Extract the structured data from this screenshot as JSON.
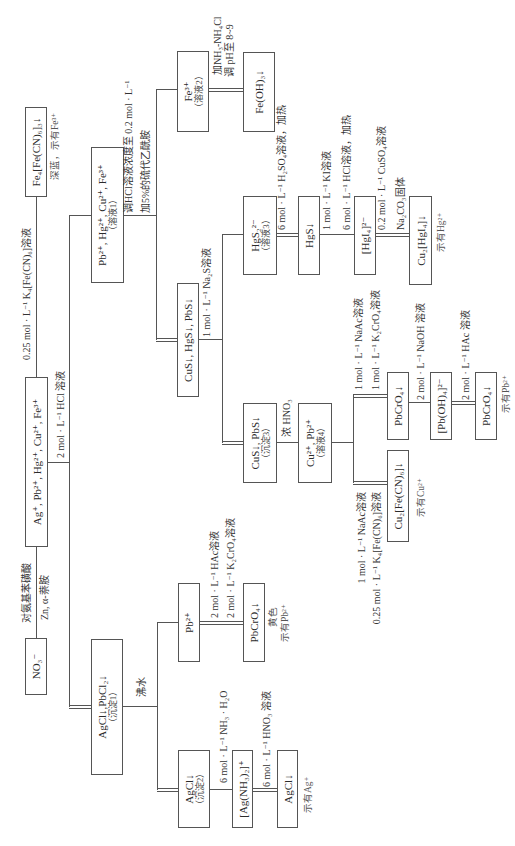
{
  "nodes": {
    "no3": {
      "label": "NO₃⁻"
    },
    "cations": {
      "label": "Ag⁺, Pb²⁺, Hg²⁺, Cu²⁺, Fe³⁺"
    },
    "fe_prussian": {
      "label": "Fe₄[Fe(CN)₆]₃↓",
      "note": "深蓝，示有Fe³⁺"
    },
    "ppt1": {
      "label": "AgCl↓,PbCl₂↓",
      "sub": "（沉淀1）"
    },
    "sol1": {
      "label": "Pb²⁺, Hg²⁺, Cu²⁺, Fe³⁺",
      "sub": "（溶液1）"
    },
    "pb": {
      "label": "Pb²⁺"
    },
    "ppt2": {
      "label": "AgCl↓",
      "sub": "（沉淀2）"
    },
    "sulfides": {
      "label": "CuS↓, HgS↓, PbS↓"
    },
    "sol2": {
      "label": "Fe³⁺",
      "sub": "（溶液2）"
    },
    "pbcro4_a": {
      "label": "PbCrO₄↓",
      "note1": "黄色",
      "note2": "示有Pb²⁺"
    },
    "ag_ammine": {
      "label": "[Ag(NH₃)₂]⁺"
    },
    "agcl_final": {
      "label": "AgCl↓",
      "note": "示有Ag⁺"
    },
    "ppt3": {
      "label": "CuS↓, PbS↓",
      "sub": "（沉淀3）"
    },
    "sol3": {
      "label": "HgS₂²⁻",
      "sub": "（溶液3）"
    },
    "feoh3": {
      "label": "Fe(OH)₃↓"
    },
    "sol4": {
      "label": "Cu²⁺, Pb²⁺",
      "sub": "（溶液4）"
    },
    "hgs": {
      "label": "HgS↓"
    },
    "hgi4": {
      "label": "[HgI₄]²⁻"
    },
    "cu2hgi4": {
      "label": "Cu₂[HgI₄]↓",
      "note": "示有Hg²⁺"
    },
    "pbcro4_b": {
      "label": "PbCrO₄↓"
    },
    "cu2fecn6": {
      "label": "Cu₂[Fe(CN)₆]↓",
      "note": "示有Cu²⁺"
    },
    "pboh4": {
      "label": "[Pb(OH)₄]²⁻"
    },
    "pbcro4_c": {
      "label": "PbCrO₄↓",
      "note": "示有Pb²⁺"
    }
  },
  "reagents": {
    "no3_test": [
      "对氨基苯磺酸",
      "Zn, α-萘胺"
    ],
    "fe_test": "0.25 mol · L⁻¹ K₄[Fe(CN)₆]溶液",
    "group_hcl": "2 mol · L⁻¹ HCl 溶液",
    "hot_water": "沸水",
    "sulfide_precip": [
      "调HCl溶液浓度至 0.2 mol · L⁻¹",
      "加5%的硫代乙酰胺"
    ],
    "pb_test": [
      "2 mol · L⁻¹ HAc溶液",
      "2 mol · L⁻¹ K₂CrO₄溶液"
    ],
    "ag_dissolve": "6 mol · L⁻¹ NH₃ · H₂O",
    "ag_reprecip": "6 mol · L⁻¹ HNO₃ 溶液",
    "na2s": "1 mol · L⁻¹ Na₂S溶液",
    "fe_precip": [
      "加NH₃-NH₄Cl",
      "调 pH至 8~9"
    ],
    "hgs_precip": "6 mol · L⁻¹ H₂SO₄溶液，加热",
    "hno3_conc": "浓 HNO₃",
    "hg_dissolve": [
      "1 mol · L⁻¹ KI溶液",
      "6 mol · L⁻¹ HCl溶液，加热"
    ],
    "hg_test": [
      "0.2 mol · L⁻¹ CuSO₄溶液",
      "Na₂CO₃固体"
    ],
    "pb_branch": [
      "1 mol · L⁻¹ NaAc溶液",
      "1 mol · L⁻¹ K₂CrO₄溶液"
    ],
    "cu_branch": [
      "1 mol · L⁻¹ NaAc溶液",
      "0.25 mol · L⁻¹ K₄[Fe(CN)₆]溶液"
    ],
    "pb_dissolve": "2 mol · L⁻¹ NaOH 溶液",
    "pb_reprecip": "2 mol · L⁻¹ HAc 溶液"
  }
}
